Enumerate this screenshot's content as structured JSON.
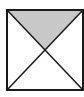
{
  "diagram": {
    "type": "geometric-figure",
    "shapes": {
      "square": {
        "x1": 7,
        "y1": 10,
        "x2": 83,
        "y2": 90,
        "stroke": "#1a1a1a",
        "fill": "#ffffff"
      },
      "diagonals": [
        {
          "from": [
            7,
            10
          ],
          "to": [
            83,
            90
          ]
        },
        {
          "from": [
            83,
            10
          ],
          "to": [
            7,
            90
          ]
        }
      ],
      "shaded_region": {
        "name": "top-triangle",
        "fill": "#c8c8c8",
        "points": [
          [
            7,
            10
          ],
          [
            83,
            10
          ],
          [
            45,
            50
          ]
        ]
      }
    },
    "colors": {
      "stroke": "#1a1a1a",
      "shade": "#c8c8c8",
      "background": "#ffffff"
    }
  }
}
